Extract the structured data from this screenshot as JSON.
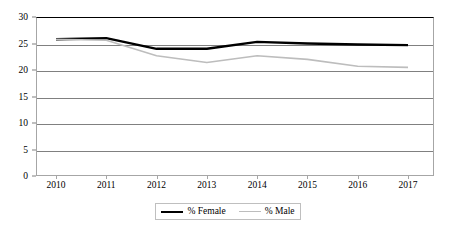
{
  "chart_data": {
    "type": "line",
    "title": "",
    "subtitle": "",
    "xlabel": "",
    "ylabel": "",
    "categories": [
      "2010",
      "2011",
      "2012",
      "2013",
      "2014",
      "2015",
      "2016",
      "2017"
    ],
    "x": [
      2010,
      2011,
      2012,
      2013,
      2014,
      2015,
      2016,
      2017
    ],
    "series": [
      {
        "name": "% Female",
        "color": "#000000",
        "line_width": 2.4,
        "values": [
          25.8,
          26.0,
          24.0,
          24.0,
          25.3,
          25.0,
          24.8,
          24.7
        ]
      },
      {
        "name": "% Male",
        "color": "#bdbdbd",
        "line_width": 1.6,
        "values": [
          25.8,
          25.6,
          22.7,
          21.4,
          22.7,
          22.0,
          20.7,
          20.5
        ]
      }
    ],
    "ylim": [
      0,
      30
    ],
    "yticks": [
      0,
      5,
      10,
      15,
      20,
      25,
      30
    ],
    "ytick_labels": [
      "0",
      "5",
      "10",
      "15",
      "20",
      "25",
      "30"
    ],
    "grid": true,
    "grid_axis": "y",
    "legend_position": "bottom",
    "legend_entries": [
      "% Female",
      "% Male"
    ]
  },
  "colors": {
    "female_line": "#000000",
    "male_line": "#bdbdbd",
    "gridline": "#808080",
    "frame": "#a6a6a6",
    "background": "#ffffff"
  }
}
